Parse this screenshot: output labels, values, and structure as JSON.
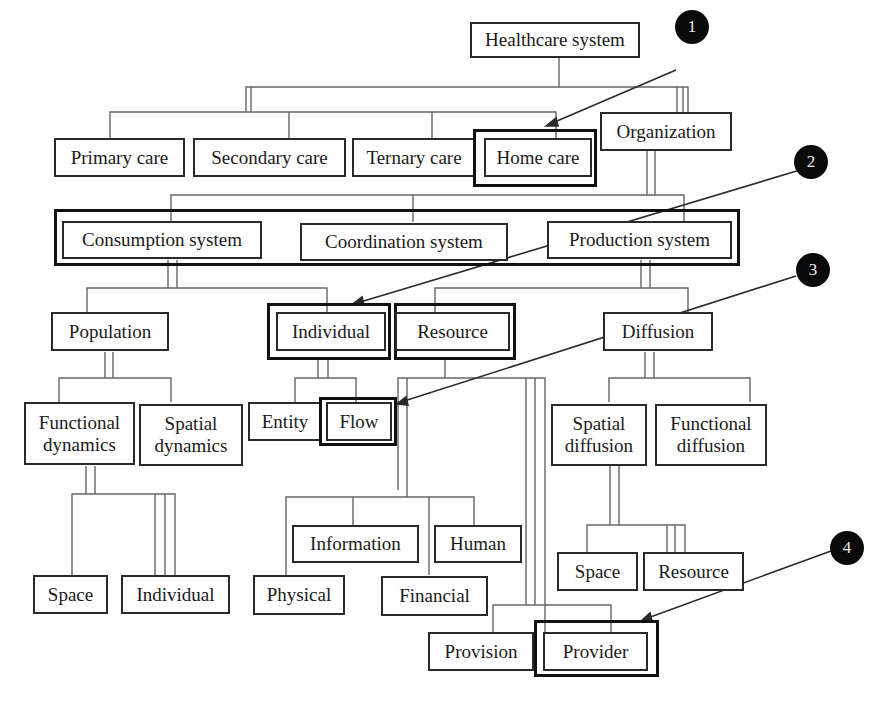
{
  "diagram": {
    "title": "Healthcare system",
    "nodes": {
      "healthcare_system": "Healthcare system",
      "primary_care": "Primary care",
      "secondary_care": "Secondary care",
      "ternary_care": "Ternary care",
      "home_care": "Home care",
      "organization": "Organization",
      "consumption_system": "Consumption system",
      "coordination_system": "Coordination system",
      "production_system": "Production system",
      "population": "Population",
      "individual": "Individual",
      "resource": "Resource",
      "diffusion": "Diffusion",
      "functional_dynamics": "Functional dynamics",
      "spatial_dynamics": "Spatial dynamics",
      "entity": "Entity",
      "flow": "Flow",
      "spatial_diffusion": "Spatial diffusion",
      "functional_diffusion": "Functional diffusion",
      "space_left": "Space",
      "individual_left": "Individual",
      "information": "Information",
      "human": "Human",
      "physical": "Physical",
      "financial": "Financial",
      "space_right": "Space",
      "resource_right": "Resource",
      "provision": "Provision",
      "provider": "Provider"
    },
    "annotations": [
      {
        "label": "1",
        "target": "Home care"
      },
      {
        "label": "2",
        "target": "Individual"
      },
      {
        "label": "3",
        "target": "Flow"
      },
      {
        "label": "4",
        "target": "Provider"
      }
    ],
    "colors": {
      "line": "#555555",
      "border": "#2a2a2a",
      "badge": "#0a0a0a",
      "background": "#ffffff"
    }
  }
}
